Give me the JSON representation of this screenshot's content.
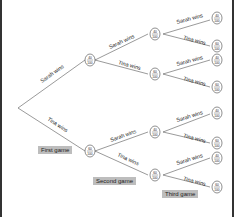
{
  "diagram": {
    "type": "probability-tree",
    "branch_labels": {
      "win_a": "Sarah wins",
      "win_b": "Tina wins"
    },
    "stages": [
      "First game",
      "Second game",
      "Third game"
    ],
    "nodes": {
      "level1": [
        {
          "id": "S",
          "num": "40",
          "den": "100"
        },
        {
          "id": "T",
          "num": "60",
          "den": "100"
        }
      ],
      "level2": [
        {
          "id": "SS",
          "num": "40",
          "den": "100"
        },
        {
          "id": "ST",
          "num": "60",
          "den": "100"
        },
        {
          "id": "TS",
          "num": "40",
          "den": "100"
        },
        {
          "id": "TT",
          "num": "60",
          "den": "100"
        }
      ],
      "level3": [
        {
          "id": "SSS",
          "num": "40",
          "den": "100"
        },
        {
          "id": "SST",
          "num": "60",
          "den": "100"
        },
        {
          "id": "STS",
          "num": "40",
          "den": "100"
        },
        {
          "id": "STT",
          "num": "60",
          "den": "100"
        },
        {
          "id": "TSS",
          "num": "40",
          "den": "100"
        },
        {
          "id": "TST",
          "num": "60",
          "den": "100"
        },
        {
          "id": "TTS",
          "num": "40",
          "den": "100"
        },
        {
          "id": "TTT",
          "num": "60",
          "den": "100"
        }
      ]
    }
  }
}
